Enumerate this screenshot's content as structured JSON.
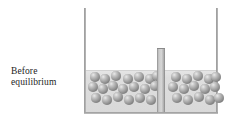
{
  "caption": {
    "line1": "Before",
    "line2": "equilibrium"
  },
  "figure": {
    "name": "solution-container-with-divider",
    "container_label": "beaker",
    "divider_label": "barrier",
    "solution_label": "solution",
    "colors": {
      "particle_dark": "#6a6a6a",
      "particle_light": "#e9e9e9",
      "solution": "#dedede",
      "wall": "#8f8f8f",
      "barrier": "#c9c9c9",
      "text": "#1d1d1d",
      "background": "#ffffff"
    },
    "geometry": {
      "container_left": 84,
      "container_right": 218,
      "container_top": 8,
      "container_bottom": 114,
      "liquid_top": 70,
      "barrier_left": 157,
      "barrier_right": 165,
      "barrier_top": 48,
      "particle_diameter": 10
    },
    "particles_left_count": 23,
    "particles_right_count": 19,
    "particles_left": [
      [
        3,
        2
      ],
      [
        13,
        4
      ],
      [
        24,
        1
      ],
      [
        36,
        4
      ],
      [
        47,
        2
      ],
      [
        58,
        4
      ],
      [
        65,
        1
      ],
      [
        1,
        12
      ],
      [
        11,
        14
      ],
      [
        21,
        11
      ],
      [
        31,
        14
      ],
      [
        42,
        12
      ],
      [
        53,
        14
      ],
      [
        63,
        11
      ],
      [
        4,
        23
      ],
      [
        15,
        25
      ],
      [
        26,
        22
      ],
      [
        37,
        25
      ],
      [
        48,
        23
      ],
      [
        59,
        25
      ],
      [
        8,
        34
      ],
      [
        19,
        33
      ],
      [
        30,
        35
      ],
      [
        41,
        33
      ],
      [
        52,
        35
      ],
      [
        62,
        33
      ],
      [
        6,
        42
      ],
      [
        17,
        43
      ],
      [
        28,
        41
      ],
      [
        39,
        43
      ],
      [
        50,
        41
      ],
      [
        61,
        43
      ]
    ],
    "particles_right": [
      [
        5,
        2
      ],
      [
        16,
        4
      ],
      [
        27,
        1
      ],
      [
        38,
        4
      ],
      [
        45,
        2
      ],
      [
        2,
        12
      ],
      [
        13,
        14
      ],
      [
        23,
        11
      ],
      [
        34,
        14
      ],
      [
        44,
        12
      ],
      [
        6,
        23
      ],
      [
        17,
        25
      ],
      [
        28,
        22
      ],
      [
        39,
        25
      ],
      [
        48,
        23
      ],
      [
        3,
        34
      ],
      [
        14,
        33
      ],
      [
        25,
        35
      ],
      [
        36,
        33
      ],
      [
        46,
        35
      ],
      [
        7,
        42
      ],
      [
        18,
        43
      ],
      [
        29,
        41
      ],
      [
        40,
        43
      ],
      [
        49,
        42
      ]
    ]
  }
}
